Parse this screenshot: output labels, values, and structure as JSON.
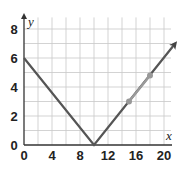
{
  "chart_data": {
    "type": "line",
    "title": "",
    "xlabel": "x",
    "ylabel": "y",
    "xlim": [
      0,
      21.5
    ],
    "ylim": [
      0,
      9
    ],
    "grid": true,
    "grid_step": {
      "x": 2,
      "y": 1
    },
    "x_ticks": [
      "0",
      "4",
      "8",
      "12",
      "16",
      "20"
    ],
    "y_ticks": [
      "0",
      "2",
      "4",
      "6",
      "8"
    ],
    "series": [
      {
        "name": "absolute value graph",
        "points": [
          [
            0,
            6
          ],
          [
            10,
            0
          ],
          [
            21.6,
            7
          ]
        ],
        "color": "#555555",
        "end_arrow": true
      },
      {
        "name": "highlighted segment",
        "points": [
          [
            15,
            3
          ],
          [
            18,
            4.8
          ]
        ],
        "color": "#9a9a9a"
      }
    ],
    "markers": [
      {
        "x": 15,
        "y": 3,
        "color": "#999999"
      },
      {
        "x": 18,
        "y": 4.8,
        "color": "#999999"
      }
    ]
  },
  "labels": {
    "x_axis": "x",
    "y_axis": "y",
    "x_ticks": [
      "0",
      "4",
      "8",
      "12",
      "16",
      "20"
    ],
    "y_ticks": [
      "0",
      "2",
      "4",
      "6",
      "8"
    ]
  }
}
